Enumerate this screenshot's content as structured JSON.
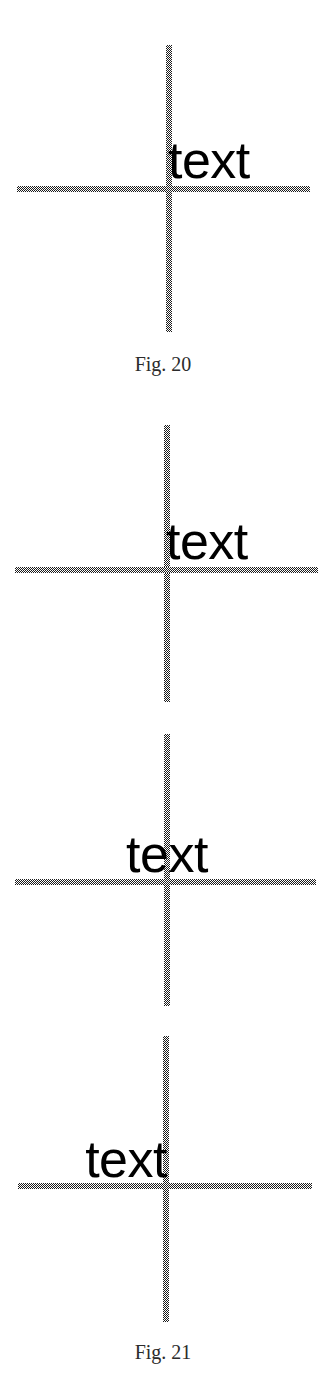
{
  "page": {
    "background_color": "#ffffff",
    "width": 326,
    "height": 1382
  },
  "style": {
    "rule_color": "#1c1c1c",
    "rule_pattern": "dithered-checkerboard",
    "rule_thickness_px": 6,
    "label_color": "#000000",
    "caption_color": "#2b2b2b"
  },
  "figures": [
    {
      "id": "fig-20",
      "caption": "Fig. 20",
      "caption_top": 352,
      "diagrams": [
        {
          "id": "fig20-diagram-1",
          "label": "text",
          "label_alignment": "left",
          "label_left": 168,
          "label_baseline_top": 134,
          "vertical_rule": {
            "x": 166,
            "y": 45,
            "length": 287
          },
          "horizontal_rule": {
            "x": 17,
            "y": 186,
            "length": 293
          }
        }
      ]
    },
    {
      "id": "fig-21",
      "caption": "Fig. 21",
      "caption_top": 1340,
      "diagrams": [
        {
          "id": "fig21-diagram-1",
          "label": "text",
          "label_alignment": "left",
          "label_left": 166,
          "label_baseline_top": 515,
          "vertical_rule": {
            "x": 164,
            "y": 425,
            "length": 277
          },
          "horizontal_rule": {
            "x": 15,
            "y": 567,
            "length": 303
          }
        },
        {
          "id": "fig21-diagram-2",
          "label": "text",
          "label_alignment": "center",
          "label_center_x": 167,
          "label_baseline_top": 828,
          "vertical_rule": {
            "x": 164,
            "y": 734,
            "length": 272
          },
          "horizontal_rule": {
            "x": 15,
            "y": 879,
            "length": 301
          }
        },
        {
          "id": "fig21-diagram-3",
          "label": "text",
          "label_alignment": "right",
          "label_right_x": 167,
          "label_baseline_top": 1133,
          "vertical_rule": {
            "x": 163,
            "y": 1036,
            "length": 286
          },
          "horizontal_rule": {
            "x": 18,
            "y": 1183,
            "length": 294
          }
        }
      ]
    }
  ]
}
